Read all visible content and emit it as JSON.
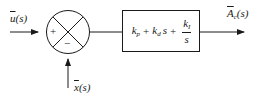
{
  "diagram": {
    "type": "block-diagram",
    "input": {
      "symbol": "u",
      "arg": "(s)",
      "overbar": true
    },
    "feedback": {
      "symbol": "x",
      "arg": "(s)",
      "overbar": true
    },
    "output": {
      "symbol": "A",
      "subscript": "c",
      "arg": "(s)",
      "overbar": true
    },
    "summing_junction": {
      "plus_sign": "+",
      "minus_sign": "−"
    },
    "controller_block": {
      "term1": {
        "symbol": "k",
        "subscript": "p"
      },
      "op1": "+",
      "term2": {
        "symbol": "k",
        "subscript": "d",
        "suffix": "s"
      },
      "op2": "+",
      "term3": {
        "numerator_symbol": "k",
        "numerator_subscript": "I",
        "denominator": "s"
      }
    },
    "colors": {
      "stroke": "#1a1a1a",
      "background": "#ffffff"
    }
  }
}
